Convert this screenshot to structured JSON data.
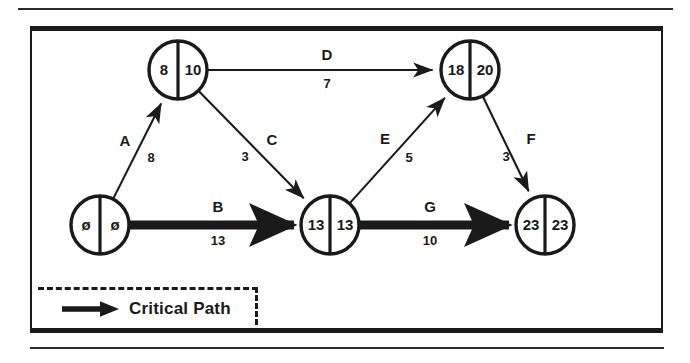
{
  "diagram": {
    "colors": {
      "ink": "#1a1a1a",
      "frame": "#1a1a1a",
      "critical": "#1a1a1a",
      "background": "#ffffff"
    },
    "nodes": [
      {
        "id": "start",
        "early": "ø",
        "late": "ø",
        "cx": 100,
        "cy": 225,
        "r": 29
      },
      {
        "id": "n2",
        "early": "8",
        "late": "10",
        "cx": 178,
        "cy": 70,
        "r": 29
      },
      {
        "id": "n3",
        "early": "13",
        "late": "13",
        "cx": 330,
        "cy": 225,
        "r": 29
      },
      {
        "id": "n4",
        "early": "18",
        "late": "20",
        "cx": 470,
        "cy": 70,
        "r": 29
      },
      {
        "id": "end",
        "early": "23",
        "late": "23",
        "cx": 545,
        "cy": 225,
        "r": 29
      }
    ],
    "edges": [
      {
        "name": "A",
        "duration": "8",
        "from": "start",
        "to": "n2",
        "critical": false,
        "name_x": 125,
        "name_y": 146,
        "dur_x": 151,
        "dur_y": 162
      },
      {
        "name": "B",
        "duration": "13",
        "from": "start",
        "to": "n3",
        "critical": true,
        "name_x": 218,
        "name_y": 212,
        "dur_x": 218,
        "dur_y": 245
      },
      {
        "name": "C",
        "duration": "3",
        "from": "n2",
        "to": "n3",
        "critical": false,
        "name_x": 272,
        "name_y": 145,
        "dur_x": 245,
        "dur_y": 161
      },
      {
        "name": "D",
        "duration": "7",
        "from": "n2",
        "to": "n4",
        "critical": false,
        "name_x": 327,
        "name_y": 60,
        "dur_x": 327,
        "dur_y": 88
      },
      {
        "name": "E",
        "duration": "5",
        "from": "n3",
        "to": "n4",
        "critical": false,
        "name_x": 385,
        "name_y": 144,
        "dur_x": 409,
        "dur_y": 162
      },
      {
        "name": "F",
        "duration": "3",
        "from": "n4",
        "to": "end",
        "critical": false,
        "name_x": 531,
        "name_y": 144,
        "dur_x": 506,
        "dur_y": 161
      },
      {
        "name": "G",
        "duration": "10",
        "from": "n3",
        "to": "end",
        "critical": true,
        "name_x": 430,
        "name_y": 212,
        "dur_x": 430,
        "dur_y": 245
      }
    ],
    "legend": {
      "label": "Critical Path",
      "symbol": "thick-arrow-icon"
    }
  }
}
